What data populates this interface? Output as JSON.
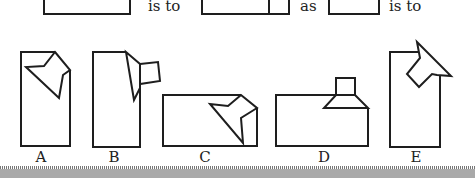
{
  "question_row": {
    "connectors": [
      {
        "text": "is to",
        "x": 148,
        "y": 2
      },
      {
        "text": "as",
        "x": 300,
        "y": 2
      },
      {
        "text": "is to",
        "x": 389,
        "y": 2
      }
    ]
  },
  "options": [
    {
      "label": "A",
      "x": 41,
      "y": 152
    },
    {
      "label": "B",
      "x": 114,
      "y": 152
    },
    {
      "label": "C",
      "x": 205,
      "y": 152
    },
    {
      "label": "D",
      "x": 324,
      "y": 152
    },
    {
      "label": "E",
      "x": 416,
      "y": 152
    }
  ],
  "colors": {
    "stroke": "#1e1e1e",
    "strip": "#a9a9a9"
  }
}
